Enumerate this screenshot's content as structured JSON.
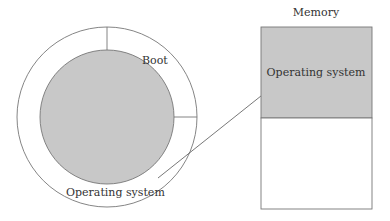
{
  "diagram": {
    "disk": {
      "boot_label": "Boot",
      "os_label": "Operating system"
    },
    "memory": {
      "title": "Memory",
      "os_label": "Operating system"
    },
    "colors": {
      "fill_gray": "#c8c8c8",
      "stroke": "#777777",
      "text": "#333333"
    }
  }
}
